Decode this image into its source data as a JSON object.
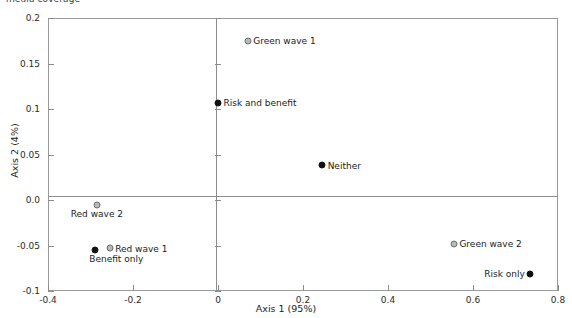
{
  "caption": {
    "text": "media coverage"
  },
  "chart_data": {
    "type": "scatter",
    "title": "",
    "xlabel": "Axis 1 (95%)",
    "ylabel": "Axis 2 (4%)",
    "xlim": [
      -0.4,
      0.8
    ],
    "ylim": [
      -0.1,
      0.2
    ],
    "grid": false,
    "legend": "none",
    "zero_axes": true,
    "xticks": [
      "-0.4",
      "-0.2",
      "0",
      "0.2",
      "0.4",
      "0.6",
      "0.8"
    ],
    "xtick_values": [
      -0.4,
      -0.2,
      0,
      0.2,
      0.4,
      0.6,
      0.8
    ],
    "yticks": [
      "0.2",
      "0.15",
      "0.1",
      "0.05",
      "0.0",
      "-0.05",
      "-0.1"
    ],
    "ytick_values": [
      0.2,
      0.15,
      0.1,
      0.05,
      0.0,
      -0.05,
      -0.1
    ],
    "marker_styles": {
      "filled": "solid black circle",
      "open": "gray circle with dark outline"
    },
    "points": [
      {
        "label": "Green wave 1",
        "x": 0.07,
        "y": 0.175,
        "style": "open",
        "label_pos": "right"
      },
      {
        "label": "Risk and benefit",
        "x": 0.0,
        "y": 0.107,
        "style": "filled",
        "label_pos": "right"
      },
      {
        "label": "Neither",
        "x": 0.245,
        "y": 0.038,
        "style": "filled",
        "label_pos": "right"
      },
      {
        "label": "Red wave 2",
        "x": -0.285,
        "y": -0.005,
        "style": "open",
        "label_pos": "below"
      },
      {
        "label": "Red wave 1",
        "x": -0.255,
        "y": -0.053,
        "style": "open",
        "label_pos": "right"
      },
      {
        "label": "Benefit only",
        "x": -0.29,
        "y": -0.055,
        "style": "filled",
        "label_pos": "below-left"
      },
      {
        "label": "Green wave 2",
        "x": 0.555,
        "y": -0.048,
        "style": "open",
        "label_pos": "right"
      },
      {
        "label": "Risk only",
        "x": 0.735,
        "y": -0.081,
        "style": "filled",
        "label_pos": "left"
      }
    ]
  },
  "colors": {
    "marker_filled": "#111111",
    "marker_open_fill": "#b9b9b9",
    "marker_open_stroke": "#6e6e6e",
    "axis": "#8c8c8c",
    "text": "#1c1c1c"
  }
}
